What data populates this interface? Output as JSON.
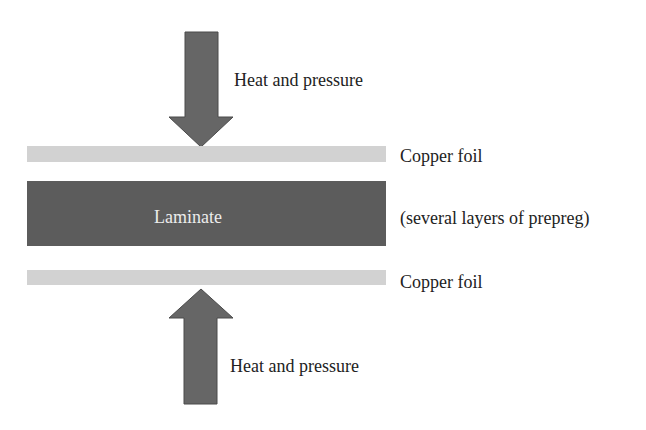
{
  "diagram": {
    "colors": {
      "arrow": "#666666",
      "copper_foil": "#d2d2d2",
      "laminate": "#5c5c5c",
      "laminate_text": "#ececec",
      "text": "#222222"
    },
    "arrows": [
      {
        "direction": "down",
        "label": "Heat and pressure"
      },
      {
        "direction": "up",
        "label": "Heat and pressure"
      }
    ],
    "layers": [
      {
        "name": "top-copper-foil",
        "label": "Copper foil"
      },
      {
        "name": "laminate",
        "inner_label": "Laminate",
        "side_label": "(several layers of prepreg)"
      },
      {
        "name": "bottom-copper-foil",
        "label": "Copper foil"
      }
    ]
  }
}
